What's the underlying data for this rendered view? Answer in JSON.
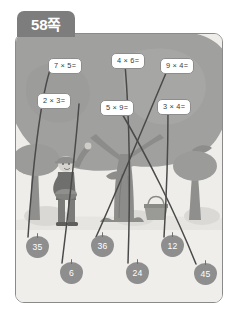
{
  "worksheet": {
    "page_tab_label": "58쪽",
    "title_icon": "page-tab",
    "background_color": "#f2f1ee",
    "border_color": "#8a8a8a",
    "tab_color": "#7d7d7d",
    "line_color": "#4a4a4a"
  },
  "scene": {
    "description_icons": {
      "person": "person-picking-fruit-icon",
      "basket": "basket-icon",
      "tree_big": "tree-icon",
      "tree_left": "tree-icon",
      "tree_right": "tree-icon",
      "foliage": "foliage-icon",
      "ground": "ground-icon"
    },
    "sky_color": "#e9e8e4",
    "foliage_color": "#9d9d9d",
    "trunk_color": "#8b8b8b",
    "ground_color": "#ededea"
  },
  "equations": [
    {
      "id": "eq-7x5",
      "text": "7 × 5=",
      "x": 48,
      "y": 58,
      "answer": "35"
    },
    {
      "id": "eq-4x6",
      "text": "4 × 6=",
      "x": 111,
      "y": 53,
      "answer": "24"
    },
    {
      "id": "eq-9x4",
      "text": "9 × 4=",
      "x": 160,
      "y": 58,
      "answer": "36"
    },
    {
      "id": "eq-2x3",
      "text": "2 × 3=",
      "x": 37,
      "y": 93,
      "answer": "6"
    },
    {
      "id": "eq-5x9",
      "text": "5 × 9=",
      "x": 100,
      "y": 100,
      "answer": "45"
    },
    {
      "id": "eq-3x4",
      "text": "3 × 4=",
      "x": 157,
      "y": 99,
      "answer": "12"
    }
  ],
  "answers": [
    {
      "id": "ans-35",
      "value": "35",
      "x": 26,
      "y": 236
    },
    {
      "id": "ans-6",
      "value": "6",
      "x": 60,
      "y": 262
    },
    {
      "id": "ans-36",
      "value": "36",
      "x": 91,
      "y": 235
    },
    {
      "id": "ans-24",
      "value": "24",
      "x": 126,
      "y": 262
    },
    {
      "id": "ans-12",
      "value": "12",
      "x": 161,
      "y": 235
    },
    {
      "id": "ans-45",
      "value": "45",
      "x": 194,
      "y": 263
    }
  ],
  "connector_lines": [
    {
      "from": "eq-7x5",
      "to": "ans-35"
    },
    {
      "from": "eq-2x3",
      "to": "ans-6"
    },
    {
      "from": "eq-9x4",
      "to": "ans-36"
    },
    {
      "from": "eq-4x6",
      "to": "ans-24"
    },
    {
      "from": "eq-3x4",
      "to": "ans-12"
    },
    {
      "from": "eq-5x9",
      "to": "ans-45"
    }
  ]
}
